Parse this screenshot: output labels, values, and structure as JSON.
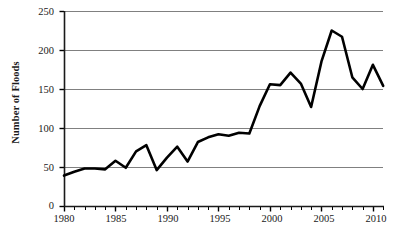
{
  "chart_data": {
    "type": "line",
    "title": "",
    "subtitle": "",
    "xlabel": "",
    "ylabel": "Number of Floods",
    "xlim": [
      1980,
      2011
    ],
    "ylim": [
      0,
      250
    ],
    "grid": "horizontal",
    "legend": "none",
    "y_ticks": [
      0,
      50,
      100,
      150,
      200,
      250
    ],
    "x_ticks_major": [
      1980,
      1985,
      1990,
      1995,
      2000,
      2005,
      2010
    ],
    "x_ticks_minor_step": 1,
    "line_color": "#000000",
    "grid_color": "#808080",
    "axis_color": "#000000",
    "x": [
      1980,
      1981,
      1982,
      1983,
      1984,
      1985,
      1986,
      1987,
      1988,
      1989,
      1990,
      1991,
      1992,
      1993,
      1994,
      1995,
      1996,
      1997,
      1998,
      1999,
      2000,
      2001,
      2002,
      2003,
      2004,
      2005,
      2006,
      2007,
      2008,
      2009,
      2010,
      2011
    ],
    "values": [
      39,
      44,
      48,
      48,
      47,
      58,
      49,
      70,
      78,
      46,
      62,
      76,
      57,
      82,
      88,
      92,
      90,
      94,
      93,
      128,
      156,
      155,
      171,
      157,
      127,
      185,
      225,
      217,
      165,
      150,
      181,
      154
    ],
    "series": [
      {
        "name": "Number of Floods",
        "values": [
          39,
          44,
          48,
          48,
          47,
          58,
          49,
          70,
          78,
          46,
          62,
          76,
          57,
          82,
          88,
          92,
          90,
          94,
          93,
          128,
          156,
          155,
          171,
          157,
          127,
          185,
          225,
          217,
          165,
          150,
          181,
          154
        ]
      }
    ]
  },
  "ticks": {
    "y": [
      "250",
      "200",
      "150",
      "100",
      "50",
      "0"
    ],
    "x": [
      "1980",
      "1985",
      "1990",
      "1995",
      "2000",
      "2005",
      "2010"
    ]
  },
  "axis": {
    "ylabel_text": "Number of Floods"
  }
}
